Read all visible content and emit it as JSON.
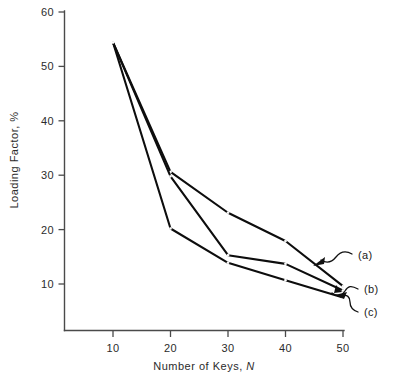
{
  "chart_data": {
    "type": "line",
    "title": "",
    "subtitle": "",
    "xlabel_prefix": "Number of Keys, ",
    "xlabel_symbol": "N",
    "ylabel": "Loading Factor, %",
    "x": [
      10,
      20,
      30,
      40,
      50
    ],
    "xlim": [
      5,
      55
    ],
    "ylim": [
      0,
      60
    ],
    "xticks": [
      10,
      20,
      30,
      40,
      50
    ],
    "yticks": [
      10,
      20,
      30,
      40,
      50,
      60
    ],
    "xtick_labels": [
      "10",
      "20",
      "30",
      "40",
      "50"
    ],
    "ytick_labels": [
      "10",
      "20",
      "30",
      "40",
      "50",
      "60"
    ],
    "grid": false,
    "legend_position": "annotations-right",
    "series": [
      {
        "name": "(a)",
        "values": [
          54.4,
          30.6,
          23.1,
          17.9,
          9.6
        ]
      },
      {
        "name": "(b)",
        "values": [
          54.4,
          29.8,
          15.3,
          13.7,
          8.8
        ]
      },
      {
        "name": "(c)",
        "values": [
          54.4,
          20.2,
          13.9,
          10.7,
          7.5
        ]
      }
    ],
    "annotations": [
      {
        "label": "(a)",
        "points_to_series": "(a)",
        "points_to_x": 50
      },
      {
        "label": "(b)",
        "points_to_series": "(b)",
        "points_to_x": 50
      },
      {
        "label": "(c)",
        "points_to_series": "(c)",
        "points_to_x": 50
      }
    ],
    "colors": {
      "line": "#0d0d0d",
      "axis": "#4a4a4a",
      "text": "#1a1a1a",
      "background": "#ffffff"
    }
  }
}
